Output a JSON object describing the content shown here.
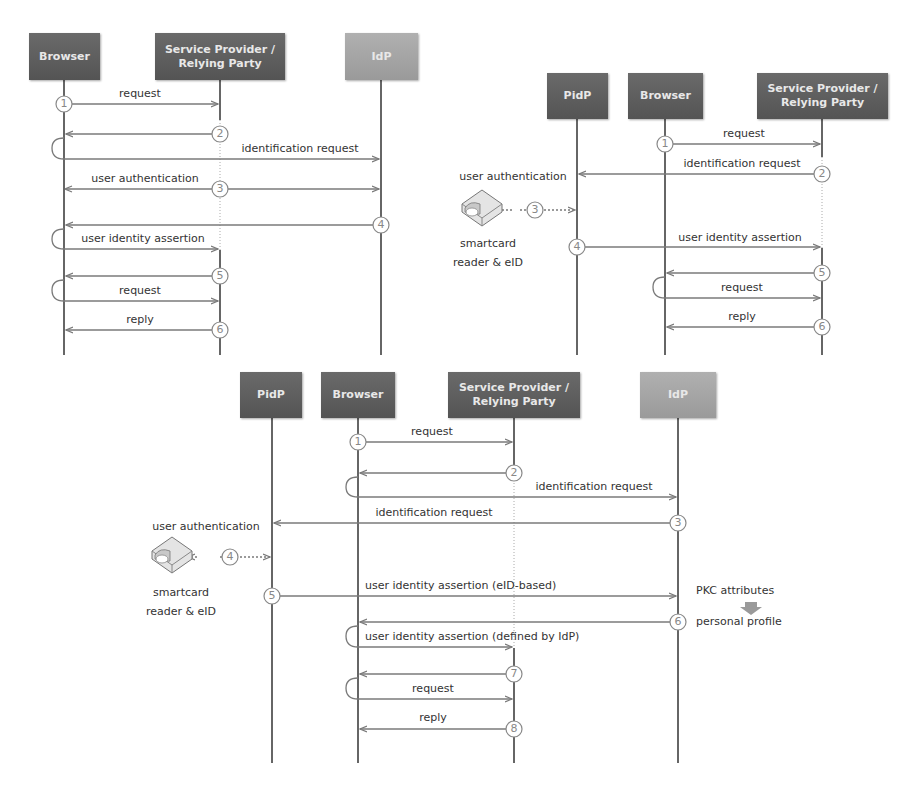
{
  "figure": "three sequence diagrams of identity protocols",
  "colors": {
    "dark_box": "#5e5e5e",
    "light_box": "#a5a5a5",
    "lifeline": "#333333",
    "arrow": "#7a7a7a",
    "text": "#333333"
  },
  "diagram1": {
    "actors": [
      {
        "label": "Browser",
        "style": "dark"
      },
      {
        "label": "Service Provider / Relying Party",
        "style": "dark"
      },
      {
        "label": "IdP",
        "style": "light"
      }
    ],
    "steps": [
      "1",
      "2",
      "3",
      "4",
      "5",
      "6"
    ],
    "messages": {
      "m1": "request",
      "m2": "identification request",
      "m3": "user authentication",
      "m4": "user identity assertion",
      "m5": "request",
      "m6": "reply"
    }
  },
  "diagram2": {
    "actors": [
      {
        "label": "PidP",
        "style": "dark"
      },
      {
        "label": "Browser",
        "style": "dark"
      },
      {
        "label": "Service Provider / Relying Party",
        "style": "dark"
      }
    ],
    "steps": [
      "1",
      "2",
      "3",
      "4",
      "5",
      "6"
    ],
    "messages": {
      "m1": "request",
      "m2": "identification request",
      "m3": "user authentication",
      "m4": "user identity assertion",
      "m5": "request",
      "m6": "reply"
    },
    "device_label_1": "smartcard",
    "device_label_2": "reader & eID"
  },
  "diagram3": {
    "actors": [
      {
        "label": "PidP",
        "style": "dark"
      },
      {
        "label": "Browser",
        "style": "dark"
      },
      {
        "label": "Service Provider / Relying Party",
        "style": "dark"
      },
      {
        "label": "IdP",
        "style": "light"
      }
    ],
    "steps": [
      "1",
      "2",
      "3",
      "4",
      "5",
      "6",
      "7",
      "8"
    ],
    "messages": {
      "m1": "request",
      "m2": "identification request",
      "m3": "identification request",
      "m4": "user authentication",
      "m5": "user identity assertion (eID-based)",
      "m6": "user identity assertion (defined by IdP)",
      "m7": "request",
      "m8": "reply"
    },
    "device_label_1": "smartcard",
    "device_label_2": "reader & eID",
    "note_1": "PKC attributes",
    "note_2": "personal profile"
  }
}
